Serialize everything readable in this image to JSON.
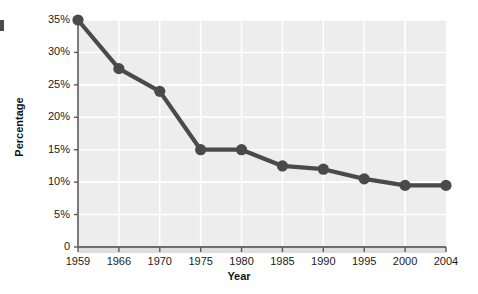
{
  "chart_data": {
    "type": "line",
    "title": "",
    "subtitle": "",
    "xlabel": "Year",
    "ylabel": "Percentage",
    "categories": [
      "1959",
      "1966",
      "1970",
      "1975",
      "1980",
      "1985",
      "1990",
      "1995",
      "2000",
      "2004"
    ],
    "values": [
      35,
      27.5,
      24,
      15,
      15,
      12.5,
      12,
      10.5,
      9.5,
      9.5
    ],
    "series": [
      {
        "name": "Percentage",
        "values": [
          35,
          27.5,
          24,
          15,
          15,
          12.5,
          12,
          10.5,
          9.5,
          9.5
        ]
      }
    ],
    "ylim": [
      0,
      35
    ],
    "xlim": [
      0,
      9
    ],
    "y_tick_labels": [
      "0",
      "5%",
      "10%",
      "15%",
      "20%",
      "25%",
      "30%",
      "35%"
    ],
    "y_tick_values": [
      0,
      5,
      10,
      15,
      20,
      25,
      30,
      35
    ],
    "x_tick_labels": [
      "1959",
      "1966",
      "1970",
      "1975",
      "1980",
      "1985",
      "1990",
      "1995",
      "2000",
      "2004"
    ],
    "grid": true,
    "grid_orientation": "both",
    "legend": false,
    "legend_position": "none",
    "marker": "circle",
    "colors": {
      "line": "#4a4a4a",
      "marker": "#4a4a4a",
      "plot_background": "#ededed",
      "grid": "#ffffff",
      "axis": "#6e6e6e",
      "page_background": "#ffffff",
      "text": "#1b1b1b"
    }
  },
  "axes": {
    "y": {
      "label": "Percentage",
      "ticks": [
        {
          "label": "0",
          "value": 0
        },
        {
          "label": "5%",
          "value": 5
        },
        {
          "label": "10%",
          "value": 10
        },
        {
          "label": "15%",
          "value": 15
        },
        {
          "label": "20%",
          "value": 20
        },
        {
          "label": "25%",
          "value": 25
        },
        {
          "label": "30%",
          "value": 30
        },
        {
          "label": "35%",
          "value": 35
        }
      ]
    },
    "x": {
      "label": "Year",
      "ticks": [
        {
          "label": "1959"
        },
        {
          "label": "1966"
        },
        {
          "label": "1970"
        },
        {
          "label": "1975"
        },
        {
          "label": "1980"
        },
        {
          "label": "1985"
        },
        {
          "label": "1990"
        },
        {
          "label": "1995"
        },
        {
          "label": "2000"
        },
        {
          "label": "2004"
        }
      ]
    }
  }
}
